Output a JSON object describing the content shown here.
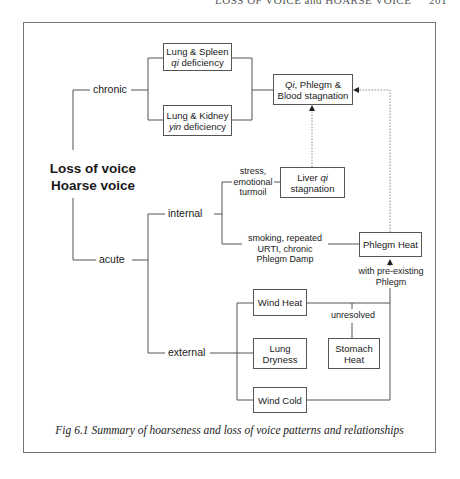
{
  "running_head": {
    "title": "LOSS OF VOICE and HOARSE VOICE",
    "page": "201"
  },
  "diagram": {
    "root": {
      "line1": "Loss of voice",
      "line2": "Hoarse voice"
    },
    "branches": {
      "chronic": "chronic",
      "acute": "acute",
      "internal": "internal",
      "external": "external"
    },
    "nodes": {
      "lung_spleen": {
        "line1": "Lung & Spleen",
        "line2_italic": "qi",
        "line2_rest": " deficiency"
      },
      "lung_kidney": {
        "line1": "Lung & Kidney",
        "line2_italic": "yin",
        "line2_rest": " deficiency"
      },
      "qi_phlegm_blood": {
        "line1_italic": "Qi",
        "line1_rest": ", Phlegm &",
        "line2": "Blood stagnation"
      },
      "liver_qi": {
        "line1_pre": "Liver ",
        "line1_italic": "qi",
        "line2": "stagnation"
      },
      "phlegm_heat": {
        "label": "Phlegm Heat"
      },
      "wind_heat": {
        "label": "Wind Heat"
      },
      "lung_dryness": {
        "line1": "Lung",
        "line2": "Dryness"
      },
      "stomach_heat": {
        "line1": "Stomach",
        "line2": "Heat"
      },
      "wind_cold": {
        "label": "Wind Cold"
      }
    },
    "edge_labels": {
      "stress": {
        "line1": "stress,",
        "line2": "emotional",
        "line3": "turmoil"
      },
      "smoking": {
        "line1": "smoking, repeated",
        "line2": "URTI, chronic",
        "line3": "Phlegm Damp"
      },
      "pre_existing": {
        "line1": "with pre-existing",
        "line2": "Phlegm"
      },
      "unresolved": "unresolved"
    }
  },
  "caption": "Fig 6.1 Summary of  hoarseness and loss of  voice patterns and relationships",
  "colors": {
    "line": "#555555",
    "dotted": "#888888",
    "text": "#1a1a1a"
  }
}
